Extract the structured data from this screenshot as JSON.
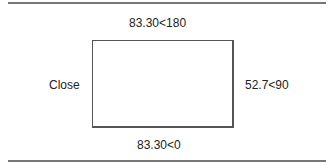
{
  "diagram": {
    "top_label": "83.30<180",
    "left_label": "Close",
    "right_label": "52.7<90",
    "bottom_label": "83.30<0"
  }
}
